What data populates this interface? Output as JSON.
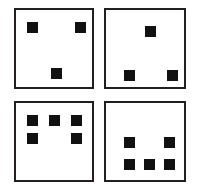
{
  "image": {
    "kind": "dot-pattern-figure",
    "width": 198,
    "height": 192,
    "background_color": "#ffffff",
    "panel_border_color": "#231f20",
    "dot_color": "#111111",
    "panel_count": 4,
    "dot_shape": "square"
  },
  "panels": [
    {
      "name": "panel-top-left",
      "position": "top-left",
      "dot_count": 3,
      "arrangement": "two upper corners and one bottom center",
      "box": {
        "x": 14,
        "y": 8,
        "w": 80,
        "h": 81
      },
      "dots": [
        {
          "name": "dot-1",
          "x": 25,
          "y": 20,
          "size": 11
        },
        {
          "name": "dot-2",
          "x": 73,
          "y": 20,
          "size": 11
        },
        {
          "name": "dot-3",
          "x": 49,
          "y": 66,
          "size": 11
        }
      ]
    },
    {
      "name": "panel-top-right",
      "position": "top-right",
      "dot_count": 3,
      "arrangement": "one top center and two bottom corners",
      "box": {
        "x": 104,
        "y": 8,
        "w": 82,
        "h": 81
      },
      "dots": [
        {
          "name": "dot-1",
          "x": 143,
          "y": 24,
          "size": 11
        },
        {
          "name": "dot-2",
          "x": 122,
          "y": 68,
          "size": 11
        },
        {
          "name": "dot-3",
          "x": 165,
          "y": 68,
          "size": 11
        }
      ]
    },
    {
      "name": "panel-bottom-left",
      "position": "bottom-left",
      "dot_count": 5,
      "arrangement": "three in top row and two below at outer columns",
      "box": {
        "x": 14,
        "y": 101,
        "w": 80,
        "h": 81
      },
      "dots": [
        {
          "name": "dot-1",
          "x": 25,
          "y": 113,
          "size": 11
        },
        {
          "name": "dot-2",
          "x": 47,
          "y": 113,
          "size": 11
        },
        {
          "name": "dot-3",
          "x": 69,
          "y": 113,
          "size": 11
        },
        {
          "name": "dot-4",
          "x": 25,
          "y": 131,
          "size": 11
        },
        {
          "name": "dot-5",
          "x": 69,
          "y": 131,
          "size": 11
        }
      ]
    },
    {
      "name": "panel-bottom-right",
      "position": "bottom-right",
      "dot_count": 5,
      "arrangement": "two in upper row at outer columns and three in bottom row",
      "box": {
        "x": 104,
        "y": 101,
        "w": 82,
        "h": 81
      },
      "dots": [
        {
          "name": "dot-1",
          "x": 122,
          "y": 135,
          "size": 11
        },
        {
          "name": "dot-2",
          "x": 162,
          "y": 135,
          "size": 11
        },
        {
          "name": "dot-3",
          "x": 122,
          "y": 157,
          "size": 11
        },
        {
          "name": "dot-4",
          "x": 142,
          "y": 157,
          "size": 11
        },
        {
          "name": "dot-5",
          "x": 162,
          "y": 157,
          "size": 11
        }
      ]
    }
  ]
}
